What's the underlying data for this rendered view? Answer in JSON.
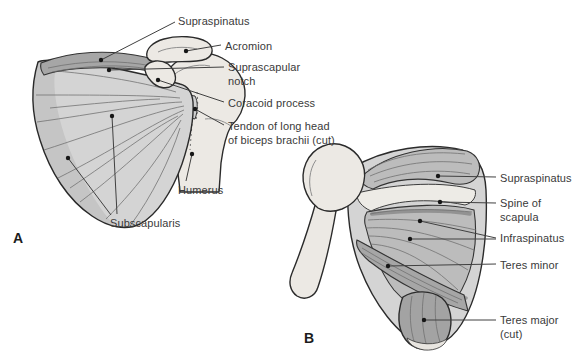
{
  "colors": {
    "background": "#ffffff",
    "outline": "#2b2b2b",
    "leader": "#404040",
    "text": "#3a3a3a",
    "bone": "#ece9e4",
    "muscle_light": "#d4d4d4",
    "muscle_mid": "#bcbcbc",
    "muscle_dark": "#a6a6a6",
    "fiber": "#6e6e6e"
  },
  "figures": [
    {
      "id": "a",
      "letter": "A",
      "letter_pos": {
        "x": 13,
        "y": 231
      },
      "labels": [
        {
          "id": "supraspinatus-a",
          "lines": [
            "Supraspinatus"
          ],
          "x": 178,
          "y": 14,
          "leaders": [
            {
              "x1": 175,
              "y1": 22,
              "x2": 101,
              "y2": 60,
              "dot": true
            }
          ]
        },
        {
          "id": "acromion",
          "lines": [
            "Acromion"
          ],
          "x": 225,
          "y": 39,
          "leaders": [
            {
              "x1": 221,
              "y1": 45,
              "x2": 186,
              "y2": 51,
              "dot": true
            }
          ]
        },
        {
          "id": "suprascapular-notch",
          "lines": [
            "Suprascapular",
            "notch"
          ],
          "x": 228,
          "y": 60,
          "leaders": [
            {
              "x1": 224,
              "y1": 67,
              "x2": 109,
              "y2": 70,
              "dot": true
            }
          ]
        },
        {
          "id": "coracoid-process",
          "lines": [
            "Coracoid process"
          ],
          "x": 228,
          "y": 96,
          "leaders": [
            {
              "x1": 224,
              "y1": 102,
              "x2": 158,
              "y2": 80,
              "dot": true
            }
          ]
        },
        {
          "id": "tendon-of-long-head",
          "lines": [
            "Tendon of long head",
            "of biceps brachii (cut)"
          ],
          "x": 228,
          "y": 119,
          "leaders": [
            {
              "x1": 224,
              "y1": 125,
              "x2": 195,
              "y2": 109,
              "dot": true
            }
          ]
        },
        {
          "id": "humerus",
          "lines": [
            "Humerus"
          ],
          "x": 178,
          "y": 183,
          "leaders": [
            {
              "x1": 186,
              "y1": 181,
              "x2": 192,
              "y2": 154,
              "dot": true
            }
          ]
        },
        {
          "id": "subscapularis",
          "lines": [
            "Subscapularis"
          ],
          "x": 110,
          "y": 216,
          "leaders": [
            {
              "x1": 117,
              "y1": 214,
              "x2": 112,
              "y2": 116,
              "dot": true
            },
            {
              "x1": 111,
              "y1": 215,
              "x2": 68,
              "y2": 158,
              "dot": true
            }
          ]
        }
      ]
    },
    {
      "id": "b",
      "letter": "B",
      "letter_pos": {
        "x": 304,
        "y": 331
      },
      "labels": [
        {
          "id": "supraspinatus-b",
          "lines": [
            "Supraspinatus"
          ],
          "x": 500,
          "y": 171,
          "leaders": [
            {
              "x1": 496,
              "y1": 177,
              "x2": 438,
              "y2": 176,
              "dot": true
            }
          ]
        },
        {
          "id": "spine-of-scapula",
          "lines": [
            "Spine of",
            "scapula"
          ],
          "x": 500,
          "y": 196,
          "leaders": [
            {
              "x1": 496,
              "y1": 203,
              "x2": 440,
              "y2": 202,
              "dot": true
            }
          ]
        },
        {
          "id": "infraspinatus",
          "lines": [
            "Infraspinatus"
          ],
          "x": 500,
          "y": 231,
          "leaders": [
            {
              "x1": 496,
              "y1": 238,
              "x2": 420,
              "y2": 221,
              "dot": true
            },
            {
              "x1": 496,
              "y1": 239,
              "x2": 410,
              "y2": 239,
              "dot": true
            }
          ]
        },
        {
          "id": "teres-minor",
          "lines": [
            "Teres minor"
          ],
          "x": 500,
          "y": 258,
          "leaders": [
            {
              "x1": 496,
              "y1": 264,
              "x2": 388,
              "y2": 266,
              "dot": true
            }
          ]
        },
        {
          "id": "teres-major-cut",
          "lines": [
            "Teres major",
            "(cut)"
          ],
          "x": 500,
          "y": 313,
          "leaders": [
            {
              "x1": 496,
              "y1": 320,
              "x2": 424,
              "y2": 320,
              "dot": true
            }
          ]
        }
      ]
    }
  ]
}
